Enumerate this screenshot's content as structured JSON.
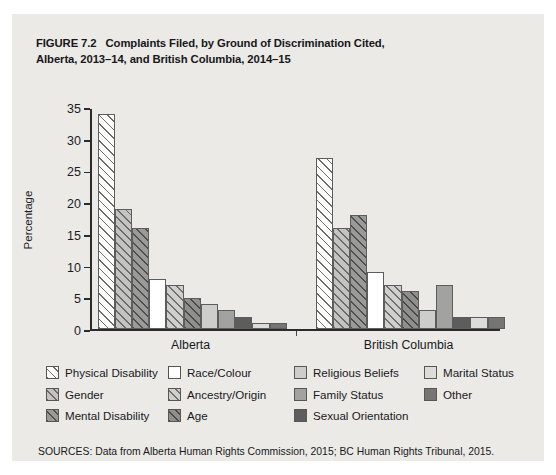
{
  "figure": {
    "number": "FIGURE 7.2",
    "title_line1": "Complaints Filed, by Ground of Discrimination Cited,",
    "title_line2": "Alberta, 2013–14, and British Columbia, 2014–15",
    "sources": "SOURCES: Data from Alberta Human Rights Commission, 2015; BC Human Rights Tribunal, 2015."
  },
  "chart_data": {
    "type": "bar",
    "title": "Complaints Filed, by Ground of Discrimination Cited, Alberta, 2013–14, and British Columbia, 2014–15",
    "xlabel": "",
    "ylabel": "Percentage",
    "ylim": [
      0,
      35
    ],
    "yticks": [
      0,
      5,
      10,
      15,
      20,
      25,
      30,
      35
    ],
    "ytick_labels": [
      "0",
      "5",
      "10",
      "15",
      "20",
      "25",
      "30",
      "35"
    ],
    "grid": false,
    "legend_position": "below",
    "categories": [
      "Alberta",
      "British Columbia"
    ],
    "series": [
      {
        "name": "Physical Disability",
        "values": [
          34,
          27
        ],
        "swatch": "p-phys"
      },
      {
        "name": "Gender",
        "values": [
          19,
          16
        ],
        "swatch": "p-gend"
      },
      {
        "name": "Mental Disability",
        "values": [
          16,
          18
        ],
        "swatch": "p-ment"
      },
      {
        "name": "Race/Colour",
        "values": [
          8,
          9
        ],
        "swatch": "p-race"
      },
      {
        "name": "Ancestry/Origin",
        "values": [
          7,
          7
        ],
        "swatch": "p-ance"
      },
      {
        "name": "Age",
        "values": [
          5,
          6
        ],
        "swatch": "p-age"
      },
      {
        "name": "Religious Beliefs",
        "values": [
          4,
          3
        ],
        "swatch": "p-reli"
      },
      {
        "name": "Family Status",
        "values": [
          3,
          7
        ],
        "swatch": "p-fami"
      },
      {
        "name": "Sexual Orientation",
        "values": [
          2,
          2
        ],
        "swatch": "p-sexu"
      },
      {
        "name": "Marital Status",
        "values": [
          1,
          2
        ],
        "swatch": "p-mari"
      },
      {
        "name": "Other",
        "values": [
          1,
          2
        ],
        "swatch": "p-othe"
      }
    ]
  },
  "legend": {
    "columns": [
      [
        "Physical Disability",
        "Gender",
        "Mental Disability"
      ],
      [
        "Race/Colour",
        "Ancestry/Origin",
        "Age"
      ],
      [
        "Religious Beliefs",
        "Family Status",
        "Sexual Orientation"
      ],
      [
        "Marital Status",
        "Other"
      ]
    ]
  },
  "colors": {
    "figure_background": "#eceae7",
    "page_background": "#ffffff",
    "axis": "#2b2b2b",
    "text": "#17191b"
  }
}
